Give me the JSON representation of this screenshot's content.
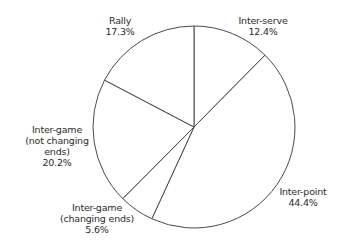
{
  "chart_data": {
    "type": "pie",
    "title": "",
    "start_angle_deg": 0,
    "direction": "clockwise",
    "categories": [
      "Inter-serve",
      "Inter-point",
      "Inter-game (changing ends)",
      "Inter-game (not changing ends)",
      "Rally"
    ],
    "values": [
      12.4,
      44.4,
      5.6,
      20.2,
      17.3
    ],
    "unit": "%",
    "legend": "none (direct labels)",
    "slice_fill": "#ffffff",
    "stroke_color": "#4a4a4a"
  },
  "labels": {
    "inter_serve": {
      "name": "Inter-serve",
      "value": "12.4%"
    },
    "inter_point": {
      "name": "Inter-point",
      "value": "44.4%"
    },
    "changing": {
      "line1": "Inter-game",
      "line2": "(changing ends)",
      "value": "5.6%"
    },
    "not_changing": {
      "line1": "Inter-game",
      "line2": "(not changing",
      "line3": "ends)",
      "value": "20.2%"
    },
    "rally": {
      "name": "Rally",
      "value": "17.3%"
    }
  }
}
